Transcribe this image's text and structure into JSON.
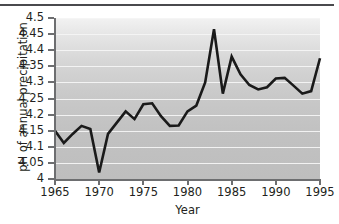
{
  "chart_data": {
    "type": "line",
    "title": "",
    "xlabel": "Year",
    "ylabel": "pH of annual precipitation",
    "xlim": [
      1965,
      1995
    ],
    "ylim": [
      4,
      4.5
    ],
    "grid": true,
    "legend": null,
    "x_ticks": [
      "1965",
      "1970",
      "1975",
      "1980",
      "1985",
      "1990",
      "1995"
    ],
    "y_ticks": [
      "4",
      "4.05",
      "4.1",
      "4.15",
      "4.2",
      "4.25",
      "4.3",
      "4.35",
      "4.4",
      "4.45",
      "4.5"
    ],
    "x": [
      1965,
      1966,
      1967,
      1968,
      1969,
      1970,
      1971,
      1972,
      1973,
      1974,
      1975,
      1976,
      1977,
      1978,
      1979,
      1980,
      1981,
      1982,
      1983,
      1984,
      1985,
      1986,
      1987,
      1988,
      1989,
      1990,
      1991,
      1992,
      1993,
      1994,
      1995
    ],
    "values": [
      4.15,
      4.112,
      4.14,
      4.165,
      4.155,
      4.02,
      4.14,
      4.175,
      4.21,
      4.186,
      4.232,
      4.235,
      4.195,
      4.165,
      4.166,
      4.21,
      4.228,
      4.3,
      4.465,
      4.265,
      4.38,
      4.325,
      4.292,
      4.278,
      4.285,
      4.312,
      4.314,
      4.29,
      4.265,
      4.273,
      4.375
    ],
    "series_color": "#1a1a1a",
    "plot_background": "#c8c8c8",
    "gridline_color": "#f4f4f4"
  }
}
